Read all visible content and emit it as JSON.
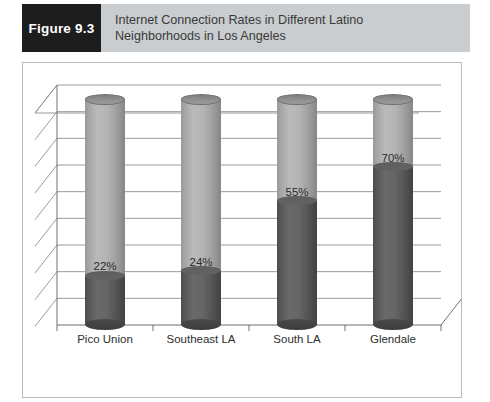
{
  "header": {
    "figure_tag": "Figure 9.3",
    "title_line1": "Internet Connection Rates in Different Latino",
    "title_line2": "Neighborhoods in Los Angeles",
    "tag_background": "#1d1d1d",
    "banner_background": "#c9cdcf"
  },
  "chart_data": {
    "type": "bar",
    "subtype": "stacked-3d-cylinder",
    "title": "Internet Connection Rates in Different Latino Neighborhoods in Los Angeles",
    "xlabel": "",
    "ylabel": "",
    "ylim": [
      0,
      100
    ],
    "grid": true,
    "gridlines": 9,
    "legend_position": "bottom-center",
    "categories": [
      "Pico Union",
      "Southeast LA",
      "South LA",
      "Glendale"
    ],
    "series": [
      {
        "name": "Online",
        "color": "#585858",
        "values": [
          22,
          24,
          55,
          70
        ],
        "labels": [
          "22%",
          "24%",
          "55%",
          "70%"
        ]
      },
      {
        "name": "Not Online",
        "color": "#b0b0b0",
        "values": [
          78,
          76,
          45,
          30
        ],
        "labels": [
          "",
          "",
          "",
          ""
        ]
      }
    ]
  },
  "legend": {
    "items": [
      {
        "label": "Not Online",
        "color": "#b0b0b0"
      },
      {
        "label": "Online",
        "color": "#585858"
      }
    ]
  }
}
